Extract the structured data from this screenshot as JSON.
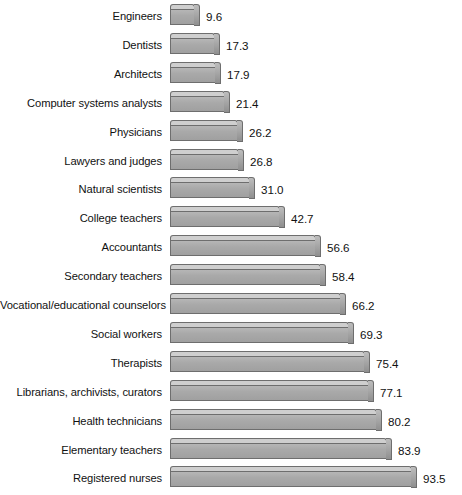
{
  "chart_data": {
    "type": "bar",
    "orientation": "horizontal",
    "title": "",
    "subtitle": "",
    "xlabel": "",
    "ylabel": "",
    "xlim": [
      0,
      100
    ],
    "grid": false,
    "legend": null,
    "categories": [
      "Engineers",
      "Dentists",
      "Architects",
      "Computer systems analysts",
      "Physicians",
      "Lawyers and judges",
      "Natural scientists",
      "College teachers",
      "Accountants",
      "Secondary teachers",
      "Vocational/educational counselors",
      "Social workers",
      "Therapists",
      "Librarians, archivists, curators",
      "Health technicians",
      "Elementary teachers",
      "Registered nurses"
    ],
    "values": [
      9.6,
      17.3,
      17.9,
      21.4,
      26.2,
      26.8,
      31.0,
      42.7,
      56.6,
      58.4,
      66.2,
      69.3,
      75.4,
      77.1,
      80.2,
      83.9,
      93.5
    ],
    "value_labels": [
      "9.6",
      "17.3",
      "17.9",
      "21.4",
      "26.2",
      "26.8",
      "31.0",
      "42.7",
      "56.6",
      "58.4",
      "66.2",
      "69.3",
      "75.4",
      "77.1",
      "80.2",
      "83.9",
      "93.5"
    ],
    "bar_fill_color": "#a9a9a9",
    "bar_top_color": "#cfcfcf",
    "bar_edge_color": "#6e6e6e",
    "background_color": "#ffffff",
    "text_color": "#111111"
  }
}
